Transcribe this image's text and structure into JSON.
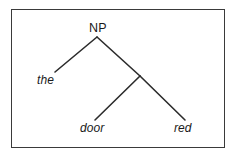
{
  "figure": {
    "name": "syntax-tree-diagram",
    "frame": {
      "border_color": "#3a3a3a",
      "background_color": "#ffffff"
    },
    "line_color": "#2b2b2b",
    "text_color": "#1a1a1a"
  },
  "tree": {
    "root": {
      "label": "NP",
      "style": "upright",
      "x": 97,
      "y": 37
    },
    "internal_nodes": [
      {
        "label": "",
        "style": "unlabeled",
        "x": 140,
        "y": 76
      }
    ],
    "terminals": [
      {
        "label": "the",
        "style": "italic",
        "x": 55,
        "y": 72
      },
      {
        "label": "door",
        "style": "italic",
        "x": 95,
        "y": 120
      },
      {
        "label": "red",
        "style": "italic",
        "x": 185,
        "y": 120
      }
    ],
    "edges": [
      {
        "name": "np-to-the",
        "x1": 97,
        "y1": 37,
        "x2": 55,
        "y2": 72
      },
      {
        "name": "np-to-internal",
        "x1": 97,
        "y1": 37,
        "x2": 140,
        "y2": 76
      },
      {
        "name": "internal-to-door",
        "x1": 140,
        "y1": 76,
        "x2": 95,
        "y2": 120
      },
      {
        "name": "internal-to-red",
        "x1": 140,
        "y1": 76,
        "x2": 185,
        "y2": 120
      }
    ]
  }
}
